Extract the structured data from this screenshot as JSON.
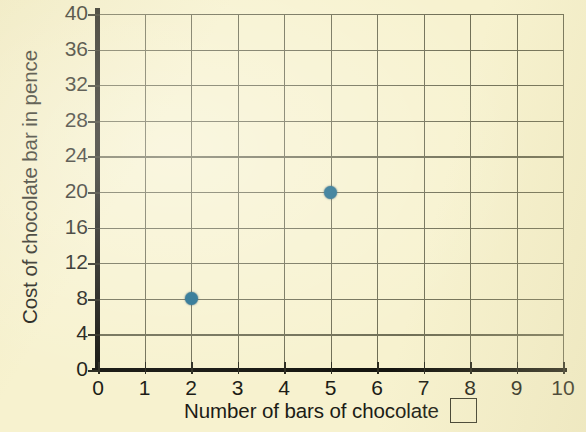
{
  "chart_data": {
    "type": "scatter",
    "title": "",
    "xlabel": "Number of bars of chocolate",
    "ylabel": "Cost of chocolate bar in pence",
    "xlim": [
      0,
      10
    ],
    "ylim": [
      0,
      40
    ],
    "x_ticks": [
      0,
      1,
      2,
      3,
      4,
      5,
      6,
      7,
      8,
      9,
      10
    ],
    "y_ticks": [
      0,
      4,
      8,
      12,
      16,
      20,
      24,
      28,
      32,
      36,
      40
    ],
    "x_tick_labels": [
      "0",
      "1",
      "2",
      "3",
      "4",
      "5",
      "6",
      "7",
      "8",
      "9",
      "10"
    ],
    "y_tick_labels": [
      "0",
      "4",
      "8",
      "12",
      "16",
      "20",
      "24",
      "28",
      "32",
      "36",
      "40"
    ],
    "grid": true,
    "legend": null,
    "series": [
      {
        "name": "cost of chocolate bars",
        "marker": "filled-circle",
        "color": "#1d6b8c",
        "points": [
          {
            "x": 2,
            "y": 8
          },
          {
            "x": 5,
            "y": 20
          }
        ]
      }
    ]
  },
  "annotations": {
    "answer_box": ""
  },
  "colors": {
    "paper_background": "#f7f2cf",
    "grid_line": "#6f6e55",
    "axis_line": "#15150f",
    "text": "#1c1c16",
    "marker": "#1d6b8c"
  }
}
